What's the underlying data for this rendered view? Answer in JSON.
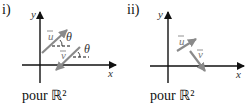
{
  "figure": {
    "panels": [
      {
        "label": "i)",
        "caption": "pour ℝ²",
        "axes": {
          "x_label": "x",
          "y_label": "y"
        },
        "vectors": [
          {
            "name": "u",
            "label": "u⃗",
            "angle_label": "θ",
            "direction": "up-right"
          },
          {
            "name": "v",
            "label": "v⃗",
            "angle_label": "θ",
            "direction": "down-left"
          }
        ],
        "note": "u and v are antiparallel (same angle θ with horizontal)"
      },
      {
        "label": "ii)",
        "caption": "pour ℝ²",
        "axes": {
          "x_label": "x",
          "y_label": "y"
        },
        "vectors": [
          {
            "name": "u",
            "label": "u⃗",
            "direction": "up-right"
          },
          {
            "name": "v",
            "label": "v⃗",
            "direction": "down-right"
          }
        ]
      }
    ],
    "colors": {
      "axis": "#111111",
      "vector": "#8a8a8a",
      "dash": "#111111"
    }
  }
}
